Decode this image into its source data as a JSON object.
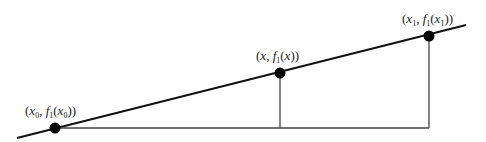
{
  "diagram": {
    "type": "linear-interpolation",
    "points": [
      {
        "id": "p0",
        "label_text": "(x0, f1(x0))",
        "x_var": "x",
        "x_sub": "0",
        "f_name": "f",
        "f_sub": "1",
        "arg": "x",
        "arg_sub": "0",
        "cx": 55,
        "cy": 128
      },
      {
        "id": "px",
        "label_text": "(x, f1(x))",
        "x_var": "x",
        "x_sub": "",
        "f_name": "f",
        "f_sub": "1",
        "arg": "x",
        "arg_sub": "",
        "cx": 280,
        "cy": 73
      },
      {
        "id": "p1",
        "label_text": "(x1, f1(x1))",
        "x_var": "x",
        "x_sub": "1",
        "f_name": "f",
        "f_sub": "1",
        "arg": "x",
        "arg_sub": "1",
        "cx": 429,
        "cy": 36
      }
    ],
    "line": {
      "x1": 17,
      "y1": 138,
      "x2": 466,
      "y2": 25
    },
    "baseline_y": 128,
    "colors": {
      "line": "#111111",
      "point": "#000000",
      "guide": "#444444"
    }
  }
}
